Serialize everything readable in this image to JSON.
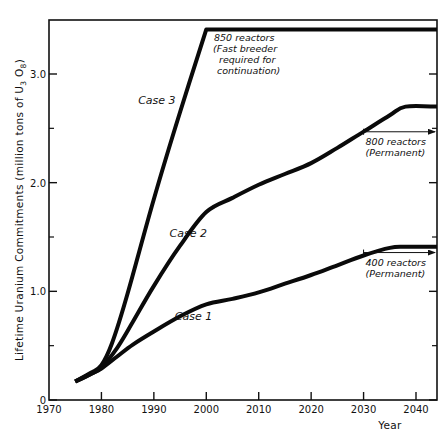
{
  "chart_data": {
    "type": "line",
    "title": "",
    "xlabel": "Year",
    "ylabel": "Lifetime Uranium Commitments (million tons of U3O8)",
    "ylabel_parts": {
      "main": "Lifetime Uranium Commitments (million tons of U",
      "sub1": "3",
      "mid": " O",
      "sub2": "8",
      "end": ")"
    },
    "xlim": [
      1970,
      2044
    ],
    "ylim": [
      0,
      3.5
    ],
    "grid": false,
    "legend": "none (inline labels)",
    "x_ticks": [
      1970,
      1980,
      1990,
      2000,
      2010,
      2020,
      2030,
      2040
    ],
    "x_tick_labels": [
      "1970",
      "1980",
      "1990",
      "2000",
      "2010",
      "2020",
      "2030",
      "2040"
    ],
    "y_ticks_major": [
      0,
      1.0,
      2.0,
      3.0
    ],
    "y_tick_labels": [
      "0",
      "1.0",
      "2.0",
      "3.0"
    ],
    "y_ticks_minor": [
      0.5,
      1.5,
      2.5
    ],
    "series": [
      {
        "name": "Case 1",
        "label": "Case 1",
        "x": [
          1975,
          1978,
          1980,
          1983,
          1986,
          1990,
          1995,
          2000,
          2005,
          2010,
          2015,
          2020,
          2025,
          2030,
          2035,
          2038,
          2044
        ],
        "y": [
          0.17,
          0.24,
          0.29,
          0.4,
          0.51,
          0.63,
          0.77,
          0.88,
          0.93,
          0.99,
          1.07,
          1.15,
          1.24,
          1.33,
          1.4,
          1.41,
          1.41
        ]
      },
      {
        "name": "Case 2",
        "label": "Case 2",
        "x": [
          1975,
          1978,
          1980,
          1983,
          1986,
          1990,
          1995,
          2000,
          2005,
          2010,
          2015,
          2020,
          2025,
          2030,
          2035,
          2038,
          2044
        ],
        "y": [
          0.17,
          0.24,
          0.3,
          0.48,
          0.72,
          1.05,
          1.42,
          1.73,
          1.86,
          1.98,
          2.08,
          2.18,
          2.32,
          2.47,
          2.62,
          2.7,
          2.7
        ]
      },
      {
        "name": "Case 3",
        "label": "Case 3",
        "x": [
          1975,
          1978,
          1980,
          1982,
          1985,
          1990,
          1995,
          2000,
          2044
        ],
        "y": [
          0.17,
          0.25,
          0.32,
          0.52,
          0.98,
          1.85,
          2.65,
          3.41,
          3.41
        ]
      }
    ],
    "annotations": [
      {
        "id": "case3_note",
        "lines": [
          "850 reactors",
          "(Fast breeder",
          "required for",
          "continuation)"
        ],
        "x": 2000,
        "y": 3.35
      },
      {
        "id": "case2_note",
        "lines": [
          "800 reactors",
          "(Permanent)"
        ],
        "arrow_from": 2030,
        "arrow_to": 2044,
        "y": 2.45
      },
      {
        "id": "case1_note",
        "lines": [
          "400 reactors",
          "(Permanent)"
        ],
        "arrow_from": 2030,
        "arrow_to": 2044,
        "y": 1.32
      }
    ],
    "case_label_positions": {
      "Case 1": {
        "x": 1994,
        "y": 0.74
      },
      "Case 2": {
        "x": 1993,
        "y": 1.5
      },
      "Case 3": {
        "x": 1987,
        "y": 2.72
      }
    }
  },
  "axes": {
    "x_title": "Year",
    "y_title": "Lifetime Uranium Commitments (million tons of U3O8)"
  }
}
